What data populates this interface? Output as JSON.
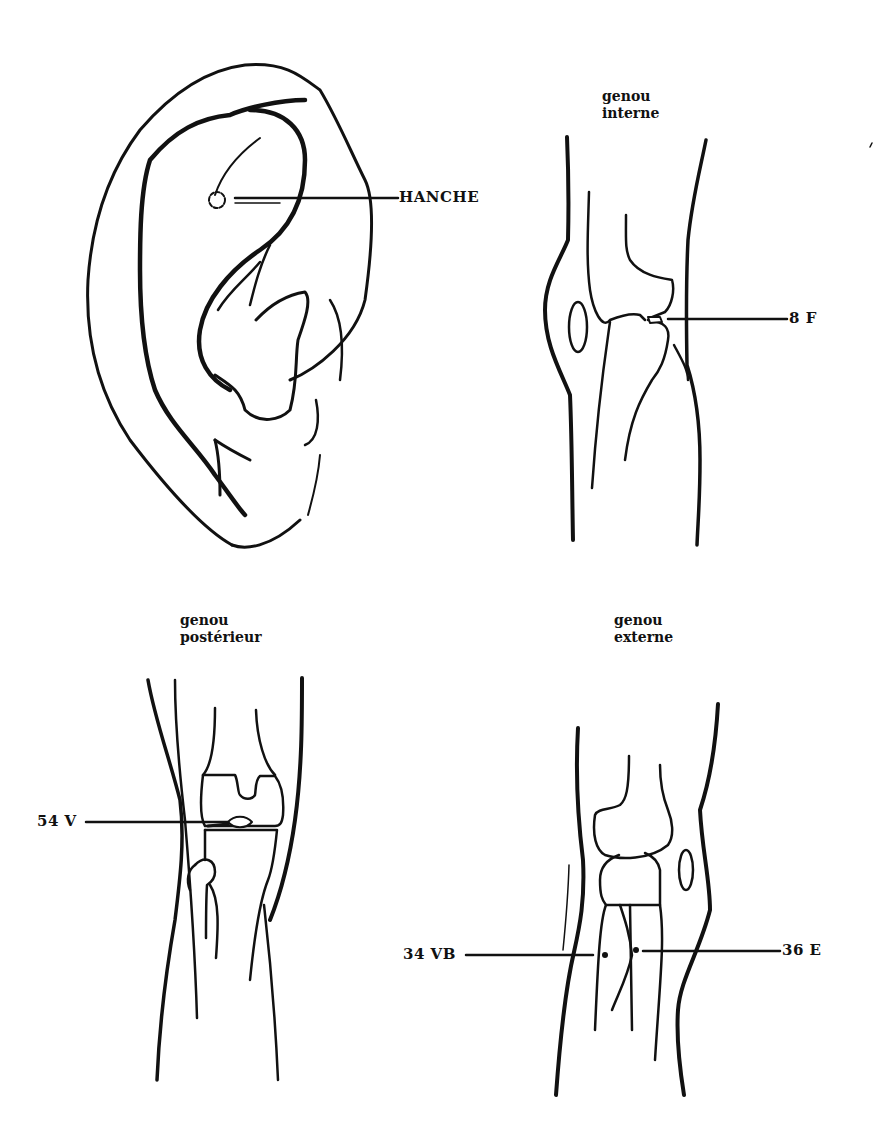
{
  "figures": {
    "ear": {
      "point_label": "HANCHE"
    },
    "knee_internal": {
      "caption_line1": "genou",
      "caption_line2": "interne",
      "point_label": "8 F"
    },
    "knee_posterior": {
      "caption_line1": "genou",
      "caption_line2": "postérieur",
      "point_label": "54 V"
    },
    "knee_external": {
      "caption_line1": "genou",
      "caption_line2": "externe",
      "point_left_label": "34 VB",
      "point_right_label": "36 E"
    }
  },
  "colors": {
    "ink": "#111111",
    "paper": "#ffffff"
  }
}
